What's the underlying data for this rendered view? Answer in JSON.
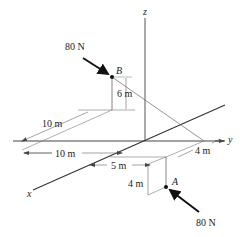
{
  "figure": {
    "type": "3D statics force diagram",
    "axes": {
      "x_label": "x",
      "y_label": "y",
      "z_label": "z"
    },
    "points": {
      "A": {
        "label": "A"
      },
      "B": {
        "label": "B"
      }
    },
    "forces": {
      "at_B": {
        "label": "80 N"
      },
      "at_A": {
        "label": "80 N"
      }
    },
    "dimensions": {
      "B_height": "6 m",
      "B_x_offset": "10 m",
      "B_y_offset": "10 m",
      "A_y_offset": "5 m",
      "A_x_offset": "4 m",
      "A_depth": "4 m"
    },
    "colors": {
      "line": "#333333",
      "thin_line": "#666666",
      "arrow": "#111111"
    }
  }
}
